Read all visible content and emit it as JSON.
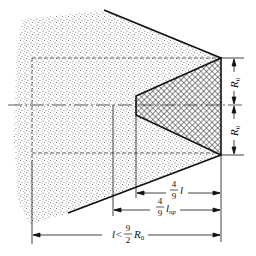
{
  "diagram": {
    "type": "technical-cross-section",
    "colors": {
      "background": "#ffffff",
      "line": "#111111",
      "stipple": "#6b6b6b",
      "hatch": "#222222"
    },
    "labels": {
      "r0_upper": "R",
      "r0_upper_sub": "0",
      "r0_lower": "R",
      "r0_lower_sub": "0",
      "dim_l_num": "4",
      "dim_l_den": "9",
      "dim_l_var": "l",
      "dim_lnp_num": "4",
      "dim_lnp_den": "9",
      "dim_lnp_var": "l",
      "dim_lnp_sub": "np",
      "dim_total_prefix": "l<",
      "dim_total_num": "9",
      "dim_total_den": "2",
      "dim_total_var": "R",
      "dim_total_sub": "0"
    }
  }
}
